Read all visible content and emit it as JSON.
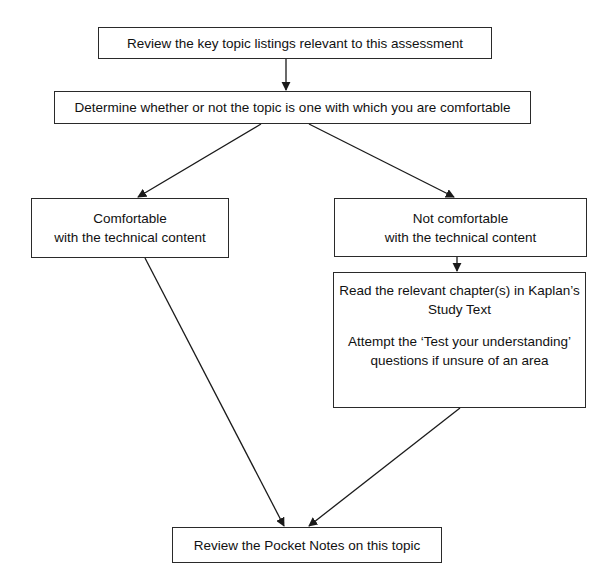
{
  "diagram": {
    "type": "flowchart",
    "colors": {
      "stroke": "#2a2a2a",
      "background": "#ffffff",
      "text": "#111111"
    },
    "nodes": [
      {
        "id": "review_listings",
        "lines": [
          "Review the key topic listings relevant to this assessment"
        ]
      },
      {
        "id": "determine_comfort",
        "lines": [
          "Determine whether or not the topic is one with which you are comfortable"
        ]
      },
      {
        "id": "comfortable",
        "lines": [
          "Comfortable",
          "with the technical content"
        ]
      },
      {
        "id": "not_comfortable",
        "lines": [
          "Not comfortable",
          "with the technical content"
        ]
      },
      {
        "id": "study_text",
        "lines": [
          "Read the relevant chapter(s) in Kaplan’s",
          "Study Text",
          "",
          "Attempt the ‘Test your understanding’",
          "questions if unsure of an area"
        ]
      },
      {
        "id": "pocket_notes",
        "lines": [
          "Review the Pocket Notes on this topic"
        ]
      }
    ],
    "edges": [
      {
        "from": "review_listings",
        "to": "determine_comfort"
      },
      {
        "from": "determine_comfort",
        "to": "comfortable"
      },
      {
        "from": "determine_comfort",
        "to": "not_comfortable"
      },
      {
        "from": "not_comfortable",
        "to": "study_text"
      },
      {
        "from": "comfortable",
        "to": "pocket_notes"
      },
      {
        "from": "study_text",
        "to": "pocket_notes"
      }
    ]
  }
}
